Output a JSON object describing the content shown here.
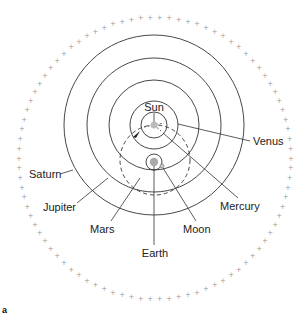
{
  "diagram": {
    "panel_label": "a",
    "colors": {
      "line": "#333333",
      "stars": "#999999",
      "body_fill": "#b8b8b8"
    },
    "labels": {
      "sun": "Sun",
      "venus": "Venus",
      "saturn": "Saturn",
      "jupiter": "Jupiter",
      "mars": "Mars",
      "earth": "Earth",
      "moon": "Moon",
      "mercury": "Mercury"
    },
    "star_sphere": {
      "cx": 155,
      "cy": 158,
      "rx": 136,
      "ry": 141,
      "count": 90,
      "glyph": "+"
    },
    "sun_centered_orbits": {
      "cx": 154,
      "cy": 125,
      "radii": [
        13,
        24,
        45,
        67,
        90
      ]
    },
    "mars_orbit_dashed": {
      "cx": 155,
      "cy": 160,
      "r": 35
    },
    "earth": {
      "cx": 154,
      "cy": 162,
      "r": 4,
      "ring_r": 8
    },
    "moon": {
      "cx": 162,
      "cy": 166,
      "r": 2
    },
    "sun": {
      "cx": 154,
      "cy": 125,
      "r": 3.5
    }
  }
}
